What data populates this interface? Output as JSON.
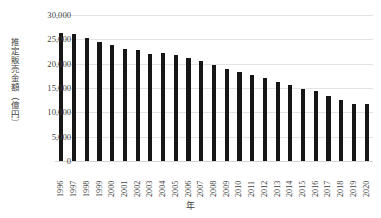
{
  "chart_data": {
    "type": "bar",
    "title": "",
    "xlabel": "年",
    "ylabel": "推定販売金額（億円）",
    "categories": [
      "1996",
      "1997",
      "1998",
      "1999",
      "2000",
      "2001",
      "2002",
      "2003",
      "2004",
      "2005",
      "2006",
      "2007",
      "2008",
      "2009",
      "2010",
      "2011",
      "2012",
      "2013",
      "2014",
      "2015",
      "2016",
      "2017",
      "2018",
      "2019",
      "2020"
    ],
    "values": [
      26300,
      26100,
      25200,
      24400,
      23800,
      23000,
      22800,
      22000,
      22100,
      21700,
      21200,
      20500,
      19800,
      19000,
      18300,
      17700,
      17000,
      16300,
      15700,
      14800,
      14400,
      13300,
      12500,
      11800,
      11700
    ],
    "ylim": [
      0,
      30000
    ],
    "yticks": [
      0,
      5000,
      10000,
      15000,
      20000,
      25000,
      30000
    ],
    "ytick_labels": [
      "0",
      "5,000",
      "10,000",
      "15,000",
      "20,000",
      "25,000",
      "30,000"
    ],
    "grid": true,
    "legend": "none",
    "bar_color": "#161616",
    "grid_color": "#e3e3e3",
    "text_color": "#3f3f3f"
  }
}
